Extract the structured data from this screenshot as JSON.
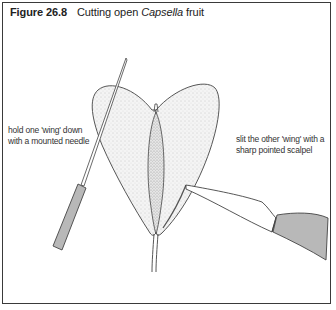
{
  "figure": {
    "number": "Figure 26.8",
    "title_prefix": "Cutting open ",
    "title_italic": "Capsella",
    "title_suffix": " fruit"
  },
  "annotations": {
    "left_line1": "hold one 'wing' down",
    "left_line2": "with a mounted needle",
    "right_line1": "slit the other 'wing' with a",
    "right_line2": "sharp pointed scalpel"
  },
  "colors": {
    "frame": "#3a3a3a",
    "outline": "#444444",
    "stipple": "#bdbdbd",
    "handle_fill": "#b8b8b8"
  }
}
